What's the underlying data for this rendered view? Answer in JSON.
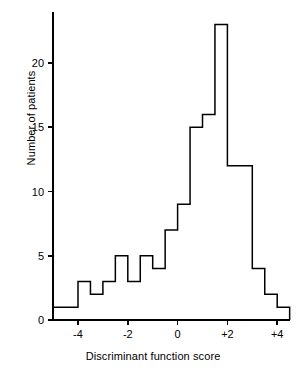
{
  "chart_data": {
    "type": "bar",
    "title": "",
    "subtitle": "",
    "xlabel": "Discriminant function score",
    "ylabel": "Number of patients",
    "xlim": [
      -5.0,
      4.5
    ],
    "ylim": [
      0,
      24
    ],
    "bin_width": 0.5,
    "grid": false,
    "legend": null,
    "xticks": [
      {
        "value": -4,
        "label": "-4"
      },
      {
        "value": -2,
        "label": "-2"
      },
      {
        "value": 0,
        "label": "0"
      },
      {
        "value": 2,
        "label": "+2"
      },
      {
        "value": 4,
        "label": "+4"
      }
    ],
    "yticks": [
      {
        "value": 0,
        "label": "0"
      },
      {
        "value": 5,
        "label": "5"
      },
      {
        "value": 10,
        "label": "10"
      },
      {
        "value": 15,
        "label": "15"
      },
      {
        "value": 20,
        "label": "20"
      }
    ],
    "bin_edges": [
      -5.0,
      -4.5,
      -4.0,
      -3.5,
      -3.0,
      -2.5,
      -2.0,
      -1.5,
      -1.0,
      -0.5,
      0.0,
      0.5,
      1.0,
      1.5,
      2.0,
      2.5,
      3.0,
      3.5,
      4.0,
      4.5
    ],
    "categories": [
      "-5.0",
      "-4.5",
      "-4.0",
      "-3.5",
      "-3.0",
      "-2.5",
      "-2.0",
      "-1.5",
      "-1.0",
      "-0.5",
      "0.0",
      "0.5",
      "1.0",
      "1.5",
      "2.0",
      "2.5",
      "3.0",
      "3.5",
      "4.0"
    ],
    "values": [
      1,
      1,
      3,
      2,
      3,
      5,
      3,
      5,
      4,
      7,
      9,
      15,
      16,
      23,
      12,
      12,
      4,
      2,
      1
    ],
    "series": [
      {
        "name": "Number of patients",
        "values": [
          1,
          1,
          3,
          2,
          3,
          5,
          3,
          5,
          4,
          7,
          9,
          15,
          16,
          23,
          12,
          12,
          4,
          2,
          1
        ]
      }
    ],
    "line_color": "#000000",
    "fill_color": "none",
    "axis_color": "#000000",
    "background": "#ffffff"
  },
  "axes": {
    "x_axis_label": "Discriminant function score",
    "y_axis_label": "Number of patients"
  }
}
